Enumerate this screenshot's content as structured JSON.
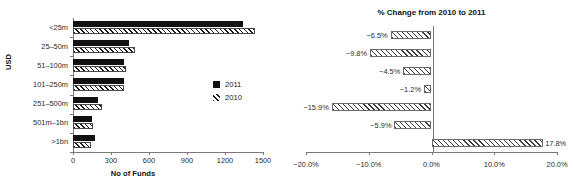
{
  "chart_data": [
    {
      "type": "bar",
      "orientation": "horizontal",
      "title": "",
      "xlabel": "No of Funds",
      "ylabel": "USD",
      "categories": [
        "<25m",
        "25–50m",
        "51–100m",
        "101–250m",
        "251–500m",
        "501m–1bn",
        ">1bn"
      ],
      "series": [
        {
          "name": "2011",
          "values": [
            1340,
            440,
            400,
            400,
            195,
            148,
            172
          ]
        },
        {
          "name": "2010",
          "values": [
            1433,
            488,
            419,
            405,
            232,
            157,
            146
          ]
        }
      ],
      "xlim": [
        0,
        1500
      ],
      "xticks": [
        0,
        300,
        600,
        900,
        1200,
        1500
      ],
      "xtick_labels": [
        "0",
        "300",
        "600",
        "900",
        "1200",
        "1500"
      ],
      "grid": false,
      "legend": {
        "position": "right",
        "entries": [
          "2011",
          "2010"
        ]
      }
    },
    {
      "type": "bar",
      "orientation": "horizontal",
      "title": "% Change from 2010 to 2011",
      "xlabel": "",
      "ylabel": "",
      "categories": [
        "<25m",
        "25–50m",
        "51–100m",
        "101–250m",
        "251–500m",
        "501m–1bn",
        ">1bn"
      ],
      "values": [
        -6.5,
        -9.8,
        -4.5,
        -1.2,
        -15.9,
        -5.9,
        17.8
      ],
      "data_labels": [
        "−6.5%",
        "−9.8%",
        "−4.5%",
        "−1.2%",
        "−15.9%",
        "−5.9%",
        "17.8%"
      ],
      "xlim": [
        -20,
        20
      ],
      "xticks": [
        -20,
        -10,
        0,
        10,
        20
      ],
      "xtick_labels": [
        "−20.0%",
        "−10.0%",
        "0.0%",
        "10.0%",
        "20.0%"
      ],
      "grid": false
    }
  ],
  "left": {
    "ylabel": "USD",
    "xlabel": "No of Funds",
    "categories": [
      {
        "label": "<25m"
      },
      {
        "label": "25–50m"
      },
      {
        "label": "51–100m"
      },
      {
        "label": "101–250m"
      },
      {
        "label": "251–500m"
      },
      {
        "label": "501m–1bn"
      },
      {
        "label": ">1bn"
      }
    ],
    "xticks": [
      {
        "label": "0"
      },
      {
        "label": "300"
      },
      {
        "label": "600"
      },
      {
        "label": "900"
      },
      {
        "label": "1200"
      },
      {
        "label": "1500"
      }
    ]
  },
  "legend": {
    "entries": [
      {
        "label": "2011",
        "style": "solid"
      },
      {
        "label": "2010",
        "style": "hatched"
      }
    ]
  },
  "right": {
    "title": "% Change from 2010 to 2011",
    "bars": [
      {
        "label": "−6.5%"
      },
      {
        "label": "−9.8%"
      },
      {
        "label": "−4.5%"
      },
      {
        "label": "−1.2%"
      },
      {
        "label": "−15.9%"
      },
      {
        "label": "−5.9%"
      },
      {
        "label": "17.8%"
      }
    ],
    "xticks": [
      {
        "label": "−20.0%"
      },
      {
        "label": "−10.0%"
      },
      {
        "label": "0.0%"
      },
      {
        "label": "10.0%"
      },
      {
        "label": "20.0%"
      }
    ]
  }
}
